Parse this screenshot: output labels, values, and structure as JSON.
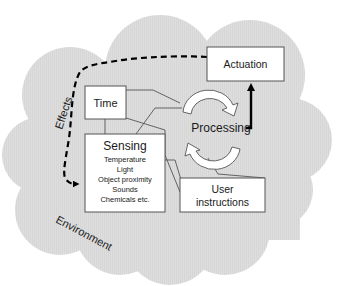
{
  "diagram": {
    "environment_label": "Environment",
    "effects_label": "Effects",
    "nodes": {
      "time": {
        "label": "Time"
      },
      "sensing": {
        "title": "Sensing",
        "items": [
          "Temperature",
          "Light",
          "Object proximity",
          "Sounds",
          "Chemicals etc."
        ]
      },
      "processing": {
        "label": "Processing"
      },
      "actuation": {
        "label": "Actuation"
      },
      "user_instructions": {
        "line1": "User",
        "line2": "instructions"
      }
    },
    "colors": {
      "cloud_fill": "#dcdcdc",
      "box_fill": "#ffffff",
      "box_stroke": "#555555",
      "connector": "#555555",
      "arrow_stroke": "#000000"
    }
  }
}
